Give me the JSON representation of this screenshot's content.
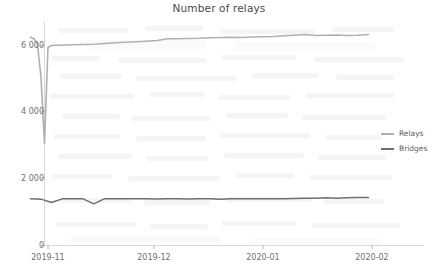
{
  "chart_data": {
    "type": "line",
    "title": "Number of relays",
    "xlabel": "",
    "ylabel": "",
    "grid": false,
    "legend_position": "right",
    "ylim": [
      0,
      7000
    ],
    "yticks": [
      0,
      2000,
      4000,
      6000
    ],
    "ytick_labels": [
      "0",
      "2 000",
      "4 000",
      "6 000"
    ],
    "xlim": [
      "2019-10-24",
      "2020-02-05"
    ],
    "xticks": [
      "2019-11",
      "2019-12",
      "2020-01",
      "2020-02"
    ],
    "xtick_labels": [
      "2019-11",
      "2019-12",
      "2020-01",
      "2020-02"
    ],
    "series": [
      {
        "name": "Relays",
        "color": "#b0b0b0",
        "x": [
          "2019-10-27",
          "2019-10-28",
          "2019-10-29",
          "2019-10-30",
          "2019-10-31",
          "2019-11-01",
          "2019-11-02",
          "2019-11-03",
          "2019-11-04",
          "2019-11-06",
          "2019-11-08",
          "2019-11-11",
          "2019-11-14",
          "2019-11-17",
          "2019-11-20",
          "2019-11-23",
          "2019-11-26",
          "2019-11-29",
          "2019-12-02",
          "2019-12-05",
          "2019-12-08",
          "2019-12-11",
          "2019-12-14",
          "2019-12-17",
          "2019-12-20",
          "2019-12-23",
          "2019-12-26",
          "2019-12-29",
          "2020-01-01",
          "2020-01-04",
          "2020-01-07",
          "2020-01-10",
          "2020-01-13",
          "2020-01-16",
          "2020-01-19",
          "2020-01-22",
          "2020-01-25",
          "2020-01-28",
          "2020-01-31"
        ],
        "values": [
          6250,
          6200,
          6050,
          5050,
          3050,
          5950,
          6000,
          6010,
          6010,
          6015,
          6020,
          6030,
          6040,
          6060,
          6080,
          6100,
          6110,
          6130,
          6150,
          6200,
          6200,
          6210,
          6215,
          6230,
          6240,
          6245,
          6240,
          6255,
          6260,
          6270,
          6290,
          6310,
          6330,
          6300,
          6305,
          6315,
          6300,
          6305,
          6330
        ]
      },
      {
        "name": "Bridges",
        "color": "#6f6f6f",
        "x": [
          "2019-10-27",
          "2019-10-30",
          "2019-11-02",
          "2019-11-05",
          "2019-11-08",
          "2019-11-11",
          "2019-11-14",
          "2019-11-17",
          "2019-11-20",
          "2019-11-23",
          "2019-11-26",
          "2019-11-29",
          "2019-12-02",
          "2019-12-05",
          "2019-12-08",
          "2019-12-11",
          "2019-12-14",
          "2019-12-17",
          "2019-12-20",
          "2019-12-23",
          "2019-12-26",
          "2019-12-29",
          "2020-01-01",
          "2020-01-04",
          "2020-01-07",
          "2020-01-10",
          "2020-01-13",
          "2020-01-16",
          "2020-01-19",
          "2020-01-22",
          "2020-01-25",
          "2020-01-28",
          "2020-01-31"
        ],
        "values": [
          1400,
          1390,
          1290,
          1400,
          1405,
          1400,
          1250,
          1400,
          1405,
          1400,
          1405,
          1400,
          1395,
          1400,
          1400,
          1395,
          1405,
          1400,
          1390,
          1400,
          1405,
          1400,
          1405,
          1400,
          1400,
          1410,
          1415,
          1420,
          1430,
          1420,
          1435,
          1440,
          1440
        ]
      }
    ]
  },
  "legend": {
    "items": [
      {
        "label": "Relays",
        "color": "#b0b0b0"
      },
      {
        "label": "Bridges",
        "color": "#6f6f6f"
      }
    ]
  },
  "axes": {
    "spine_color": "#d8d8d8",
    "tick_color": "#9a9a9a"
  }
}
